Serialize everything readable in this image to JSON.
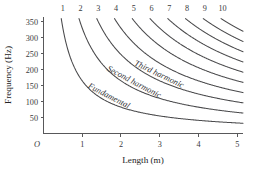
{
  "chart_data": {
    "type": "line",
    "title": "",
    "xlabel": "Length (m)",
    "ylabel": "Frequency (Hz)",
    "xlim": [
      0,
      5.15
    ],
    "ylim": [
      0,
      365
    ],
    "xticks": [
      "1",
      "2",
      "3",
      "4",
      "5"
    ],
    "xtick_values": [
      1,
      2,
      3,
      4,
      5
    ],
    "yticks": [
      "50",
      "100",
      "150",
      "200",
      "250",
      "300",
      "350"
    ],
    "ytick_values": [
      50,
      100,
      150,
      200,
      250,
      300,
      350
    ],
    "origin_label": "O",
    "grid": false,
    "legend_position": "inline-on-curves",
    "relation": "f = n * 165 / L",
    "constant_hz_m": 165,
    "series": [
      {
        "name": "1",
        "harmonic": 1,
        "label": "Fundamental",
        "x": [
          0.47,
          0.6,
          0.8,
          1.0,
          1.25,
          1.5,
          2.0,
          2.5,
          3.0,
          3.5,
          4.0,
          4.5,
          5.0
        ],
        "values": [
          351,
          275,
          206,
          165,
          132,
          110,
          82.5,
          66,
          55,
          47.1,
          41.3,
          36.7,
          33
        ]
      },
      {
        "name": "2",
        "harmonic": 2,
        "label": "Second harmonic",
        "x": [
          0.94,
          1.1,
          1.3,
          1.6,
          2.0,
          2.5,
          3.0,
          3.5,
          4.0,
          4.5,
          5.0
        ],
        "values": [
          351,
          300,
          254,
          206,
          165,
          132,
          110,
          94.3,
          82.5,
          73.3,
          66
        ]
      },
      {
        "name": "3",
        "harmonic": 3,
        "label": "Third harmonic",
        "x": [
          1.41,
          1.6,
          2.0,
          2.4,
          2.8,
          3.2,
          3.6,
          4.0,
          4.5,
          5.0
        ],
        "values": [
          351,
          309,
          248,
          206,
          177,
          155,
          137.5,
          124,
          110,
          99
        ]
      },
      {
        "name": "4",
        "harmonic": 4,
        "label": "",
        "x": [
          1.88,
          2.2,
          2.6,
          3.0,
          3.5,
          4.0,
          4.5,
          5.0
        ],
        "values": [
          351,
          300,
          254,
          220,
          188.6,
          165,
          146.7,
          132
        ]
      },
      {
        "name": "5",
        "harmonic": 5,
        "label": "",
        "x": [
          2.35,
          2.7,
          3.1,
          3.6,
          4.1,
          4.6,
          5.0
        ],
        "values": [
          351,
          305.6,
          266,
          229,
          201,
          179,
          165
        ]
      },
      {
        "name": "6",
        "harmonic": 6,
        "label": "",
        "x": [
          2.82,
          3.2,
          3.6,
          4.1,
          4.6,
          5.0
        ],
        "values": [
          351,
          309,
          275,
          241,
          215,
          198
        ]
      },
      {
        "name": "7",
        "harmonic": 7,
        "label": "",
        "x": [
          3.29,
          3.7,
          4.1,
          4.5,
          5.0
        ],
        "values": [
          351,
          312,
          281.7,
          256.7,
          231
        ]
      },
      {
        "name": "8",
        "harmonic": 8,
        "label": "",
        "x": [
          3.77,
          4.1,
          4.5,
          5.0
        ],
        "values": [
          350,
          322,
          293.3,
          264
        ]
      },
      {
        "name": "9",
        "harmonic": 9,
        "label": "",
        "x": [
          4.24,
          4.6,
          5.0
        ],
        "values": [
          350,
          322.8,
          297
        ]
      },
      {
        "name": "10",
        "harmonic": 10,
        "label": "",
        "x": [
          4.71,
          5.0
        ],
        "values": [
          350,
          330
        ]
      }
    ],
    "curve_labels": [
      {
        "text": "Fundamental",
        "harmonic": 1
      },
      {
        "text": "Second harmonic",
        "harmonic": 2
      },
      {
        "text": "Third harmonic",
        "harmonic": 3
      }
    ],
    "harmonic_numbers": [
      "1",
      "2",
      "3",
      "4",
      "5",
      "6",
      "7",
      "8",
      "9",
      "10"
    ]
  },
  "colors": {
    "curve": "#4a4a4c",
    "axis": "#58585a",
    "text": "#2e2e30",
    "background": "#ffffff"
  }
}
